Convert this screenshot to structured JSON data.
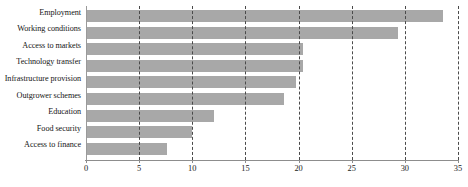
{
  "chart_data": {
    "type": "bar",
    "orientation": "horizontal",
    "title": "",
    "subtitle": "",
    "xlabel": "",
    "ylabel": "",
    "xlim": [
      0,
      35
    ],
    "ylim": null,
    "xticks": [
      "0",
      "5",
      "10",
      "15",
      "20",
      "25",
      "30",
      "35"
    ],
    "xtick_values": [
      0,
      5,
      10,
      15,
      20,
      25,
      30,
      35
    ],
    "grid": true,
    "grid_axis": "x",
    "grid_style": "dashed",
    "legend": false,
    "legend_position": "none",
    "bar_color": "#a8a8a8",
    "gridline_color": "#4a4a4a",
    "axis_color": "#8d8d8d",
    "categories": [
      "Employment",
      "Working conditions",
      "Access to markets",
      "Technology transfer",
      "Infrastructure provision",
      "Outgrower schemes",
      "Education",
      "Food security",
      "Access to finance"
    ],
    "values": [
      33.6,
      29.4,
      20.4,
      20.4,
      19.8,
      18.6,
      12.0,
      10.0,
      7.6
    ]
  },
  "caption": {
    "cutoff_text": ""
  }
}
